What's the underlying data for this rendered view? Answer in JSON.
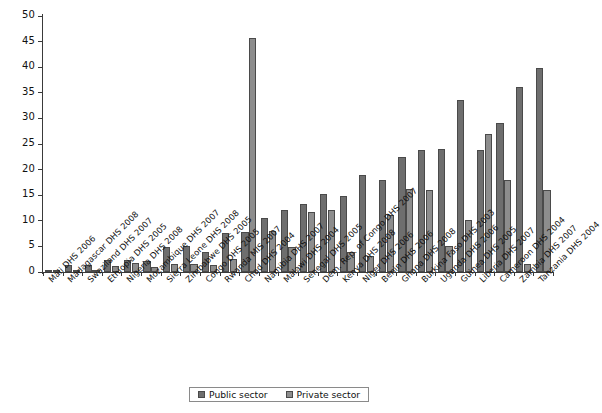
{
  "chart_data": {
    "type": "bar",
    "title": "",
    "subtitle": "",
    "xlabel": "",
    "ylabel": "",
    "ylim": [
      0,
      50
    ],
    "yticks": [
      0,
      5,
      10,
      15,
      20,
      25,
      30,
      35,
      40,
      45,
      50
    ],
    "grid": false,
    "legend_position": "bottom-center",
    "colors": {
      "public": "#6e6e6e",
      "private": "#8d8d8d",
      "axis": "#3a3a3a",
      "text": "#111111",
      "background": "#ffffff"
    },
    "categories": [
      "Mali DHS 2006",
      "Madagascar DHS 2008",
      "Swaziland DHS 2007",
      "Ethiopia DHS 2005",
      "Nigeria DHS 2008",
      "Mozambique DHS 2007",
      "Sierra Leone DHS 2008",
      "Zimbabwe DHS 2005",
      "Congo DHS 2005",
      "Rwanda MIS 2007",
      "Chad DHS 2004",
      "Namibia DHS 2007",
      "Malawi DHS 2004",
      "Senegal DHS 2005",
      "Dem. Rep. of Congo DHS 2007",
      "Kenya DHS 2008",
      "Niger DHS 2006",
      "Benin DHS 2006",
      "Ghana DHS 2008",
      "Burkina Faso DHS 2003",
      "Uganda DHS 2006",
      "Guinea DHS 2005",
      "Liberia DHS 2007",
      "Cameroon DHS 2004",
      "Zambia DHS 2007",
      "Tanzania DHS 2004"
    ],
    "series": [
      {
        "name": "Public sector",
        "color": "#6e6e6e",
        "values": [
          0.3,
          1.3,
          1.3,
          2.3,
          2.4,
          2.2,
          4.8,
          5.1,
          4.0,
          7.6,
          7.9,
          10.5,
          12.1,
          13.3,
          15.3,
          14.9,
          18.9,
          17.9,
          22.4,
          23.9,
          24.0,
          33.5,
          23.9,
          29.2,
          36.1,
          39.9
        ],
        "value_unit": "percent"
      },
      {
        "name": "Private sector",
        "color": "#8d8d8d",
        "values": [
          0.2,
          0.4,
          0.3,
          1.2,
          1.7,
          0.9,
          1.6,
          1.5,
          1.4,
          2.6,
          45.7,
          8.1,
          4.9,
          11.8,
          12.1,
          4.0,
          3.1,
          11.2,
          16.2,
          16.0,
          5.0,
          10.1,
          27.0,
          17.9,
          1.6,
          16.0
        ],
        "value_unit": "percent"
      }
    ]
  },
  "legend": {
    "items": [
      {
        "label": "Public sector",
        "key": "public"
      },
      {
        "label": "Private sector",
        "key": "private"
      }
    ]
  }
}
